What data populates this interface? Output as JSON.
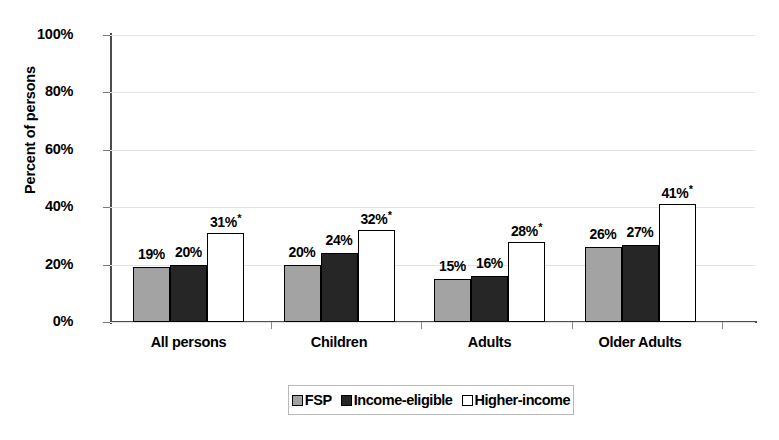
{
  "chart_data": {
    "type": "bar",
    "title": "",
    "xlabel": "",
    "ylabel": "Percent of persons",
    "ylim": [
      0,
      100
    ],
    "ytick_labels": [
      "0%",
      "20%",
      "40%",
      "60%",
      "80%",
      "100%"
    ],
    "ytick_values": [
      0,
      20,
      40,
      60,
      80,
      100
    ],
    "grid": true,
    "legend_position": "bottom-center",
    "categories": [
      "All persons",
      "Children",
      "Adults",
      "Older Adults"
    ],
    "series": [
      {
        "name": "FSP",
        "color": "#a3a3a3",
        "values": [
          19,
          20,
          15,
          26
        ],
        "labels": [
          "19%",
          "20%",
          "15%",
          "26%"
        ],
        "significance": [
          false,
          false,
          false,
          false
        ]
      },
      {
        "name": "Income-eligible",
        "color": "#262626",
        "values": [
          20,
          24,
          16,
          27
        ],
        "labels": [
          "20%",
          "24%",
          "16%",
          "27%"
        ],
        "significance": [
          false,
          false,
          false,
          false
        ]
      },
      {
        "name": "Higher-income",
        "color": "#ffffff",
        "values": [
          31,
          32,
          28,
          41
        ],
        "labels": [
          "31%",
          "32%",
          "28%",
          "41%"
        ],
        "significance": [
          true,
          true,
          true,
          true
        ]
      }
    ],
    "significance_marker": "*"
  },
  "legend": {
    "items": [
      {
        "label": "FSP"
      },
      {
        "label": "Income-eligible"
      },
      {
        "label": "Higher-income"
      }
    ]
  }
}
